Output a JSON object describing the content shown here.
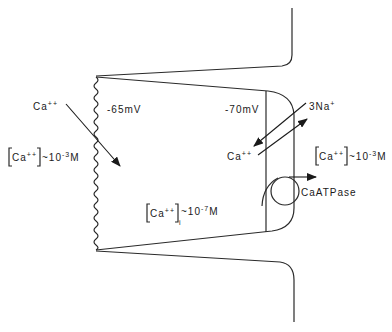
{
  "diagram": {
    "type": "cell-junction calcium transport schematic",
    "labels": {
      "ca_extracellular_left": "Ca",
      "ca_extracellular_left_charge": "++",
      "potential_left": "-65mV",
      "potential_right": "-70mV",
      "conc_left_base": "Ca",
      "conc_left_charge": "++",
      "conc_left_value": "~10",
      "conc_left_exp": "-3",
      "conc_left_unit": "M",
      "conc_inner_base": "Ca",
      "conc_inner_charge": "++",
      "conc_inner_sub": "i",
      "conc_inner_value": "~10",
      "conc_inner_exp": "-7",
      "conc_inner_unit": "M",
      "exchanger_na": "3Na",
      "exchanger_na_charge": "+",
      "exchanger_ca": "Ca",
      "exchanger_ca_charge": "++",
      "conc_right_base": "Ca",
      "conc_right_charge": "++",
      "conc_right_value": "~10",
      "conc_right_exp": "-3",
      "conc_right_unit": "M",
      "pump": "CaATPase"
    },
    "colors": {
      "stroke": "#2a2a2a",
      "background": "#ffffff"
    }
  }
}
